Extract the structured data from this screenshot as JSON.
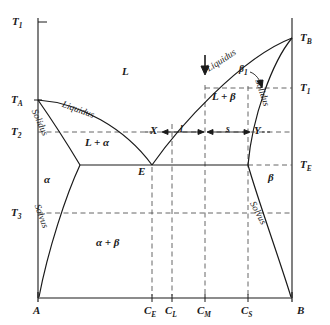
{
  "figure": {
    "type": "binary-eutectic-phase-diagram",
    "stroke_color": "#1a1a1a",
    "dash_color": "#555555",
    "background": "#ffffff"
  },
  "axes": {
    "y_axis_name": "temperature-axis",
    "x_axis_name": "composition-axis",
    "temperature_ticks": [
      {
        "label": "T",
        "sub": "1",
        "y": 22
      },
      {
        "label": "T",
        "sub": "A",
        "y": 100
      },
      {
        "label": "T",
        "sub": "2",
        "y": 132
      },
      {
        "label": "T",
        "sub": "3",
        "y": 213
      }
    ],
    "temperature_ticks_right": [
      {
        "label": "T",
        "sub": "B",
        "y": 38
      },
      {
        "label": "T",
        "sub": "1",
        "y": 88
      },
      {
        "label": "T",
        "sub": "E",
        "y": 165
      }
    ],
    "composition_ticks": [
      {
        "label": "A",
        "sub": "",
        "x": 38
      },
      {
        "label": "C",
        "sub": "E",
        "x": 152
      },
      {
        "label": "C",
        "sub": "L",
        "x": 172
      },
      {
        "label": "C",
        "sub": "M",
        "x": 205
      },
      {
        "label": "C",
        "sub": "S",
        "x": 248
      },
      {
        "label": "B",
        "sub": "",
        "x": 292
      }
    ]
  },
  "regions": [
    {
      "name": "liquid-region",
      "text": "L",
      "x": 122,
      "y": 72
    },
    {
      "name": "liquid-plus-alpha-region",
      "text": "L + α",
      "x": 85,
      "y": 143
    },
    {
      "name": "liquid-plus-beta-region",
      "text": "L + β",
      "x": 215,
      "y": 97
    },
    {
      "name": "alpha-region",
      "text": "α",
      "x": 45,
      "y": 180
    },
    {
      "name": "beta-region",
      "text": "β",
      "x": 270,
      "y": 178
    },
    {
      "name": "alpha-plus-beta-region",
      "text": "α + β",
      "x": 100,
      "y": 243
    }
  ],
  "curve_labels": [
    {
      "name": "liquidus-label-left",
      "text": "Liquidus",
      "x": 72,
      "y": 104,
      "rotate": 22
    },
    {
      "name": "liquidus-label-right",
      "text": "Liquidus",
      "x": 212,
      "y": 60,
      "rotate": -34
    },
    {
      "name": "solidus-label-left",
      "text": "Solidus",
      "x": 36,
      "y": 126,
      "rotate": 72
    },
    {
      "name": "solidus-label-right",
      "text": "Solidus",
      "x": 263,
      "y": 82,
      "rotate": 70
    },
    {
      "name": "solvus-label-left",
      "text": "Solvus",
      "x": 38,
      "y": 215,
      "rotate": 76
    },
    {
      "name": "solvus-label-right",
      "text": "Solvus",
      "x": 258,
      "y": 215,
      "rotate": 62
    }
  ],
  "points": [
    {
      "name": "eutectic-point-label",
      "text": "E",
      "x": 141,
      "y": 172
    },
    {
      "name": "tie-line-left-label",
      "text": "X",
      "x": 152,
      "y": 127
    },
    {
      "name": "tie-line-right-label",
      "text": "Y",
      "x": 256,
      "y": 127
    },
    {
      "name": "beta-one-label",
      "text": "β",
      "sub": "1",
      "x": 240,
      "y": 70
    }
  ],
  "tie_line": {
    "name": "tie-line",
    "y": 132,
    "left_x": 161,
    "right_x": 252,
    "mid_x": 205,
    "segment_liquid_label": "l",
    "segment_solid_label": "s",
    "liquid_label_x": 182,
    "solid_label_x": 228
  },
  "cooling_arrow": {
    "name": "cooling-direction-arrow",
    "x": 205,
    "y_start": 55,
    "y_end": 73
  }
}
